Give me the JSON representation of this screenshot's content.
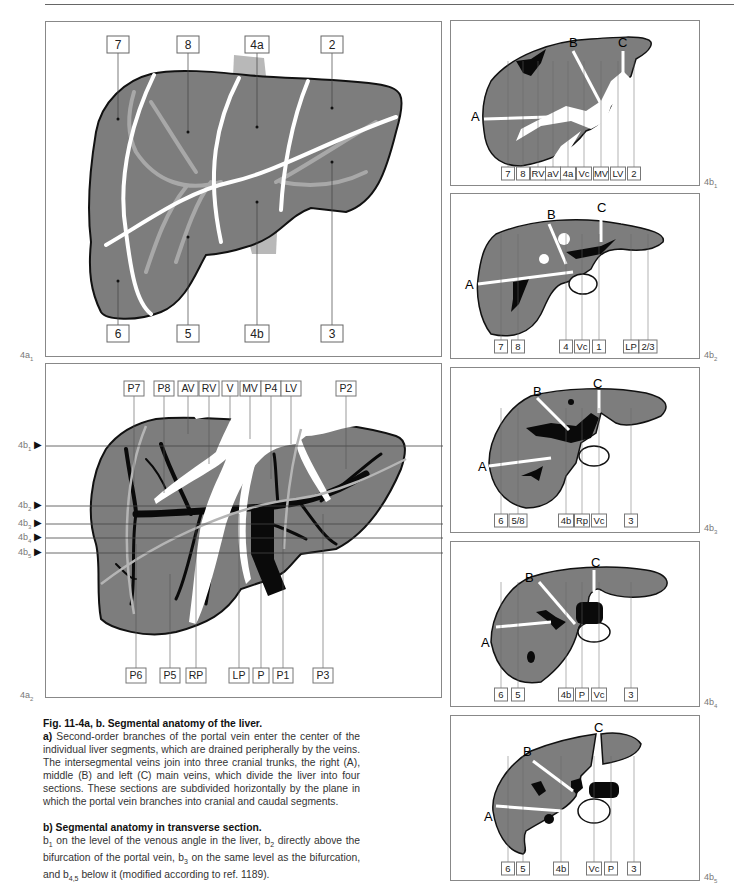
{
  "figure": {
    "panel_labels": {
      "a1": {
        "base": "4a",
        "sub": "1"
      },
      "a2": {
        "base": "4a",
        "sub": "2"
      },
      "b1": {
        "base": "4b",
        "sub": "1"
      },
      "b2": {
        "base": "4b",
        "sub": "2"
      },
      "b3": {
        "base": "4b",
        "sub": "3"
      },
      "b4": {
        "base": "4b",
        "sub": "4"
      },
      "b5": {
        "base": "4b",
        "sub": "5"
      }
    },
    "panel_a1": {
      "top_labels": [
        "7",
        "8",
        "4a",
        "2"
      ],
      "bottom_labels": [
        "6",
        "5",
        "4b",
        "3"
      ]
    },
    "panel_a2": {
      "top_labels": [
        "P7",
        "P8",
        "AV",
        "RV",
        "V",
        "MV",
        "P4",
        "LV",
        "P2"
      ],
      "bottom_labels": [
        "P6",
        "P5",
        "RP",
        "LP",
        "P",
        "P1",
        "P3"
      ],
      "level_markers": [
        {
          "base": "4b",
          "sub": "1"
        },
        {
          "base": "4b",
          "sub": "2"
        },
        {
          "base": "4b",
          "sub": "3"
        },
        {
          "base": "4b",
          "sub": "4"
        },
        {
          "base": "4b",
          "sub": "5"
        }
      ]
    },
    "panel_b1": {
      "vein_labels": [
        "A",
        "B",
        "C"
      ],
      "bottom_labels": [
        "7",
        "8",
        "RV",
        "aV",
        "4a",
        "Vc",
        "MV",
        "LV",
        "2"
      ]
    },
    "panel_b2": {
      "vein_labels": [
        "A",
        "B",
        "C"
      ],
      "bottom_labels": [
        "7",
        "8",
        "4",
        "Vc",
        "1",
        "LP",
        "2/3"
      ]
    },
    "panel_b3": {
      "vein_labels": [
        "A",
        "B",
        "C"
      ],
      "bottom_labels": [
        "6",
        "5/8",
        "4b",
        "Rp",
        "Vc",
        "3"
      ]
    },
    "panel_b4": {
      "vein_labels": [
        "A",
        "B",
        "C"
      ],
      "bottom_labels": [
        "6",
        "5",
        "4b",
        "P",
        "Vc",
        "3"
      ]
    },
    "panel_b5": {
      "vein_labels": [
        "A",
        "B",
        "C"
      ],
      "bottom_labels": [
        "6",
        "5",
        "4b",
        "Vc",
        "P",
        "3"
      ]
    }
  },
  "caption": {
    "title": "Fig. 11-4a, b. Segmental anatomy of the liver.",
    "a_label": "a)",
    "a_text": " Second-order branches of the portal vein enter the center of the individual liver segments, which are drained peripherally by the veins. The intersegmental veins join into three cranial trunks, the right (A), middle (B) and left (C) main veins, which divide the liver into four sections. These sections are subdivided horizontally by the plane in which the portal vein branches into cranial and caudal segments.",
    "b_title": "b) Segmental anatomy in transverse section.",
    "b_text": {
      "p1": "b",
      "s1": "1",
      "t1": " on the level of the venous angle in the liver, b",
      "s2": "2",
      "t2": " directly above the bifurcation of the portal vein, b",
      "s3": "3",
      "t3": " on the same level as the bifurcation, and b",
      "s4": "4,5",
      "t4": " below it (modified according to ref. 1189)."
    }
  },
  "colors": {
    "liver_fill": "#7d7d7d",
    "outline": "#111111",
    "vessel_light": "#b0b0b0",
    "white_vein": "#ffffff",
    "portal_black": "#0a0a0a"
  }
}
